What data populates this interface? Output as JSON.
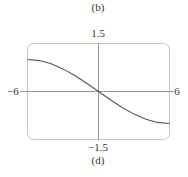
{
  "labels": {
    "top_caption": "(b)",
    "bottom_caption": "(d)",
    "y_max": "1.5",
    "y_min": "−1.5",
    "x_min": "−6",
    "x_max": "6"
  },
  "chart_data": {
    "type": "line",
    "title": "",
    "xlabel": "",
    "ylabel": "",
    "xlim": [
      -6,
      6
    ],
    "ylim": [
      -1.5,
      1.5
    ],
    "grid": false,
    "legend": null,
    "annotations": [
      "(b)",
      "(d)"
    ],
    "series": [
      {
        "name": "f(x)",
        "x": [
          -6,
          -5,
          -4,
          -3,
          -2,
          -1,
          0,
          1,
          2,
          3,
          4,
          5,
          6
        ],
        "values": [
          1.0,
          0.966,
          0.866,
          0.707,
          0.5,
          0.259,
          0.0,
          -0.259,
          -0.5,
          -0.707,
          -0.866,
          -0.966,
          -1.0
        ]
      }
    ],
    "colors": {
      "curve": "#555555",
      "axes": "#888888",
      "frame": "#bbbbbb"
    }
  }
}
